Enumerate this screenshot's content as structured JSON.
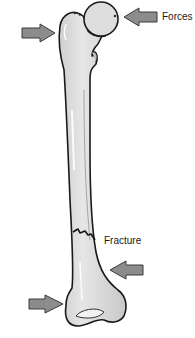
{
  "figure": {
    "labels": {
      "forces": "Forces",
      "fracture": "Fracture"
    },
    "caption_partial": "",
    "arrows": [
      {
        "name": "force-arrow-upper-left",
        "direction": "right"
      },
      {
        "name": "force-arrow-upper-right",
        "direction": "left"
      },
      {
        "name": "force-arrow-lower-right",
        "direction": "left"
      },
      {
        "name": "force-arrow-lower-left",
        "direction": "right"
      }
    ],
    "colors": {
      "bone_fill": "#d9d9d9",
      "bone_outline": "#1a1a1a",
      "arrow_fill": "#8c8c8c",
      "arrow_outline": "#3a3a3a",
      "background": "#ffffff"
    }
  }
}
